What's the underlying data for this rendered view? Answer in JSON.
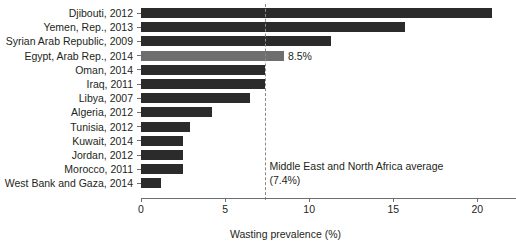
{
  "chart_data": {
    "type": "bar",
    "orientation": "horizontal",
    "title": "",
    "subtitle": "",
    "xlabel": "Wasting prevalence (%)",
    "ylabel": "",
    "xlim": [
      0,
      22.3
    ],
    "grid": false,
    "legend": null,
    "xticks": [
      0,
      5,
      10,
      15,
      20
    ],
    "xticklabels": [
      "0",
      "5",
      "10",
      "15",
      "20"
    ],
    "categories": [
      "Djibouti, 2012",
      "Yemen, Rep., 2013",
      "Syrian Arab Republic, 2009",
      "Egypt, Arab Rep., 2014",
      "Oman, 2014",
      "Iraq, 2011",
      "Libya, 2007",
      "Algeria, 2012",
      "Tunisia, 2012",
      "Kuwait, 2014",
      "Jordan, 2012",
      "Morocco, 2011",
      "West Bank and Gaza, 2014"
    ],
    "values": [
      20.9,
      15.7,
      11.3,
      8.5,
      7.4,
      7.4,
      6.5,
      4.2,
      2.9,
      2.5,
      2.5,
      2.5,
      1.2
    ],
    "highlight_index": 3,
    "bar_color": "#2b2b2b",
    "highlight_color": "#6e6e6e",
    "data_labels": [
      null,
      null,
      null,
      "8.5%",
      null,
      null,
      null,
      null,
      null,
      null,
      null,
      null,
      null
    ],
    "reference_line": {
      "value": 7.4,
      "style": "dashed",
      "color": "#8a8a8a",
      "label_line1": "Middle East and North Africa average",
      "label_line2": "(7.4%)"
    }
  }
}
